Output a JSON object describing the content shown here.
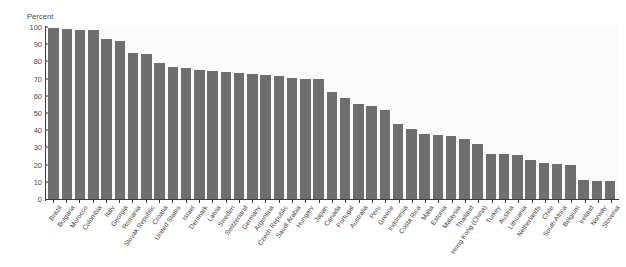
{
  "chart_data": {
    "type": "bar",
    "title": "",
    "subtitle": "",
    "xlabel": "",
    "ylabel": "Percent",
    "ylim": [
      0,
      100
    ],
    "yticks": [
      0,
      10,
      20,
      30,
      40,
      50,
      60,
      70,
      80,
      90,
      100
    ],
    "ytick_labels": [
      "0",
      "10",
      "20",
      "30",
      "40",
      "50",
      "60",
      "70",
      "80",
      "90",
      "100"
    ],
    "grid": false,
    "legend": "none",
    "bar_color": "#6e6e6e",
    "plot_background": "#fbfbfb",
    "categories": [
      "Brazil",
      "Bulgaria",
      "Morocco",
      "Colombia",
      "Italy",
      "Georgia",
      "Romania",
      "Slovak Republic",
      "Croatia",
      "United States",
      "Israel",
      "Denmark",
      "Latvia",
      "Sweden",
      "Switzerland",
      "Germany",
      "Argentina",
      "Czech Republic",
      "Saudi Arabia",
      "Hungary",
      "Japan",
      "Canada",
      "Portugal",
      "Australia",
      "Peru",
      "Greece",
      "Indonesia",
      "Costa Rica",
      "Malta",
      "Estonia",
      "Malaysia",
      "Thailand",
      "Hong Kong (China)",
      "Turkey",
      "Austria",
      "Lithuania",
      "Netherlands",
      "Chile",
      "South Africa",
      "Belgium",
      "Ireland",
      "Norway",
      "Slovenia"
    ],
    "values": [
      99.5,
      99.0,
      98.5,
      98.0,
      93.0,
      92.0,
      85.0,
      84.5,
      79.0,
      77.0,
      76.0,
      75.0,
      74.5,
      74.0,
      73.5,
      72.5,
      72.0,
      71.5,
      70.5,
      70.0,
      69.5,
      62.0,
      58.5,
      55.0,
      54.0,
      52.0,
      43.5,
      40.5,
      38.0,
      37.5,
      36.5,
      35.0,
      32.0,
      26.0,
      26.0,
      25.5,
      22.5,
      21.0,
      20.5,
      19.5,
      11.0,
      10.5,
      10.5
    ]
  }
}
